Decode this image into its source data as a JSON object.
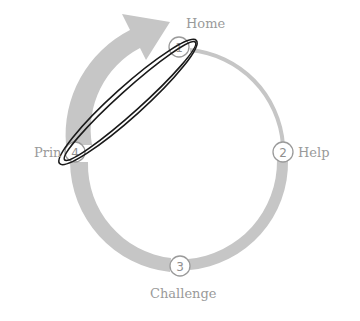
{
  "diagram": {
    "colors": {
      "band": "#c4c4c4",
      "circle_stroke": "#9a9a9a",
      "label": "#9a9a9a",
      "annotation": "#1a1a1a"
    },
    "nodes": [
      {
        "number": "1",
        "label": "Home"
      },
      {
        "number": "2",
        "label": "Help"
      },
      {
        "number": "3",
        "label": "Challenge"
      },
      {
        "number": "4",
        "label": "Print"
      }
    ],
    "visible_label_4": "Prin",
    "annotation": "hand-drawn-ellipse-around-1-and-4"
  }
}
